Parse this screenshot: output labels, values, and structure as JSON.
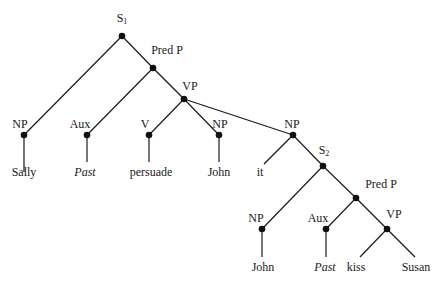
{
  "diagram": {
    "type": "syntax-tree",
    "colors": {
      "line": "#1a1a1a",
      "node": "#111111",
      "background": "#ffffff"
    },
    "nodes": [
      {
        "id": "S1",
        "label": "S",
        "sub": "1",
        "x": 122,
        "y": 36,
        "lx": 122,
        "ly": 19
      },
      {
        "id": "PredP1",
        "label": "Pred P",
        "x": 153,
        "y": 68,
        "lx": 167,
        "ly": 50
      },
      {
        "id": "VP1",
        "label": "VP",
        "x": 184,
        "y": 99,
        "lx": 190,
        "ly": 86
      },
      {
        "id": "NP1",
        "label": "NP",
        "x": 24,
        "y": 135,
        "lx": 20,
        "ly": 124
      },
      {
        "id": "Aux1",
        "label": "Aux",
        "x": 87,
        "y": 135,
        "lx": 80,
        "ly": 124
      },
      {
        "id": "V1",
        "label": "V",
        "x": 149,
        "y": 135,
        "lx": 145,
        "ly": 124
      },
      {
        "id": "NP2",
        "label": "NP",
        "x": 219,
        "y": 135,
        "lx": 220,
        "ly": 124
      },
      {
        "id": "NP3",
        "label": "NP",
        "x": 293,
        "y": 135,
        "lx": 292,
        "ly": 124
      },
      {
        "id": "S2",
        "label": "S",
        "sub": "2",
        "x": 323,
        "y": 166,
        "lx": 324,
        "ly": 151
      },
      {
        "id": "PredP2",
        "label": "Pred P",
        "x": 356,
        "y": 198,
        "lx": 381,
        "ly": 184
      },
      {
        "id": "NP4",
        "label": "NP",
        "x": 262,
        "y": 229,
        "lx": 256,
        "ly": 218
      },
      {
        "id": "Aux2",
        "label": "Aux",
        "x": 326,
        "y": 229,
        "lx": 318,
        "ly": 218
      },
      {
        "id": "VP2",
        "label": "VP",
        "x": 387,
        "y": 229,
        "lx": 394,
        "ly": 214
      }
    ],
    "leaves": [
      {
        "id": "L_Sally",
        "text": "Sally",
        "italic": false,
        "x": 24,
        "y": 172,
        "tx": 24,
        "ty": 172
      },
      {
        "id": "L_Past1",
        "text": "Past",
        "italic": true,
        "x": 87,
        "y": 162,
        "tx": 85,
        "ty": 172
      },
      {
        "id": "L_persuade",
        "text": "persuade",
        "italic": false,
        "x": 149,
        "y": 162,
        "tx": 151,
        "ty": 172
      },
      {
        "id": "L_John1",
        "text": "John",
        "italic": false,
        "x": 219,
        "y": 162,
        "tx": 219,
        "ty": 172
      },
      {
        "id": "L_it",
        "text": "it",
        "italic": false,
        "x": 264,
        "y": 164,
        "tx": 260,
        "ty": 172
      },
      {
        "id": "L_John2",
        "text": "John",
        "italic": false,
        "x": 262,
        "y": 257,
        "tx": 263,
        "ty": 267
      },
      {
        "id": "L_Past2",
        "text": "Past",
        "italic": true,
        "x": 326,
        "y": 257,
        "tx": 325,
        "ty": 267
      },
      {
        "id": "L_kiss",
        "text": "kiss",
        "italic": false,
        "x": 360,
        "y": 257,
        "tx": 356,
        "ty": 267
      },
      {
        "id": "L_Susan",
        "text": "Susan",
        "italic": false,
        "x": 415,
        "y": 257,
        "tx": 416,
        "ty": 267
      }
    ],
    "edges": [
      [
        "S1",
        "NP1"
      ],
      [
        "S1",
        "PredP1"
      ],
      [
        "PredP1",
        "Aux1"
      ],
      [
        "PredP1",
        "VP1"
      ],
      [
        "VP1",
        "V1"
      ],
      [
        "VP1",
        "NP2"
      ],
      [
        "VP1",
        "NP3"
      ],
      [
        "NP1",
        "L_Sally"
      ],
      [
        "Aux1",
        "L_Past1"
      ],
      [
        "V1",
        "L_persuade"
      ],
      [
        "NP2",
        "L_John1"
      ],
      [
        "NP3",
        "L_it"
      ],
      [
        "NP3",
        "S2"
      ],
      [
        "S2",
        "NP4"
      ],
      [
        "S2",
        "PredP2"
      ],
      [
        "PredP2",
        "Aux2"
      ],
      [
        "PredP2",
        "VP2"
      ],
      [
        "NP4",
        "L_John2"
      ],
      [
        "Aux2",
        "L_Past2"
      ],
      [
        "VP2",
        "L_kiss"
      ],
      [
        "VP2",
        "L_Susan"
      ]
    ]
  }
}
